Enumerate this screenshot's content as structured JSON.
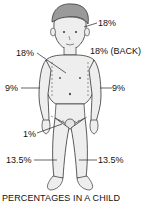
{
  "diagram": {
    "labels": {
      "head": "18%",
      "back": "18% (BACK)",
      "front_trunk": "18%",
      "right_arm": "9%",
      "left_arm": "9%",
      "genitals": "1%",
      "right_leg": "13.5%",
      "left_leg": "13.5%"
    },
    "caption": "PERCENTAGES IN A CHILD"
  }
}
